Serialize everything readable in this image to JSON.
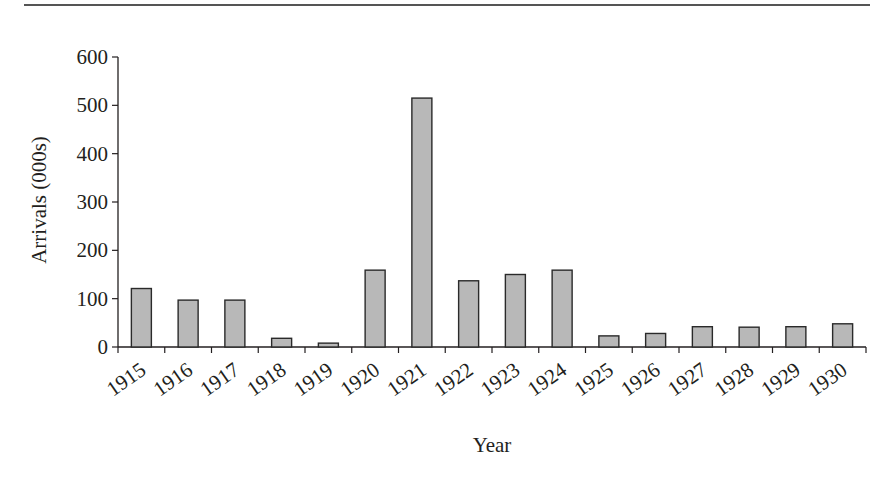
{
  "chart_data": {
    "type": "bar",
    "title": "",
    "xlabel": "Year",
    "ylabel": "Arrivals (000s)",
    "ylim": [
      0,
      600
    ],
    "yticks": [
      0,
      100,
      200,
      300,
      400,
      500,
      600
    ],
    "grid": false,
    "legend": null,
    "categories": [
      "1915",
      "1916",
      "1917",
      "1918",
      "1919",
      "1920",
      "1921",
      "1922",
      "1923",
      "1924",
      "1925",
      "1926",
      "1927",
      "1928",
      "1929",
      "1930"
    ],
    "values": [
      121,
      97,
      97,
      18,
      8,
      159,
      515,
      137,
      150,
      159,
      23,
      28,
      42,
      41,
      42,
      48
    ],
    "bar_fill": "#b8b8b8",
    "bar_stroke": "#2a2a2a"
  }
}
